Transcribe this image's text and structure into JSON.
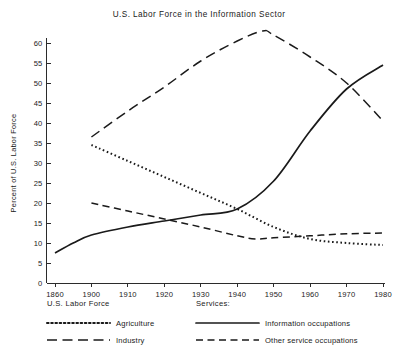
{
  "chart_data": {
    "type": "line",
    "title": "U.S. Labor Force in the Information Sector",
    "xlabel": "",
    "ylabel": "Percent of U.S. Labor Force",
    "xlim": [
      1860,
      1980
    ],
    "ylim": [
      0,
      63
    ],
    "yticks": [
      0,
      5,
      10,
      15,
      20,
      25,
      30,
      35,
      40,
      45,
      50,
      55,
      60
    ],
    "ytick_labels": [
      "0",
      "5",
      "10",
      "15",
      "20",
      "25",
      "30",
      "35",
      "40",
      "45",
      "50",
      "55",
      "60"
    ],
    "xticks": [
      1860,
      1900,
      1910,
      1920,
      1930,
      1940,
      1950,
      1960,
      1970,
      1980
    ],
    "xtick_labels": [
      "1860",
      "1900",
      "1910",
      "1920",
      "1930",
      "1940",
      "1950",
      "1960",
      "1970",
      "1980"
    ],
    "grid": false,
    "legend_position": "below-axes",
    "axis_note": "x axis is non-linear: 1860 and 1900 share one tick interval, decades evenly spaced thereafter",
    "series": [
      {
        "name": "Agriculture",
        "group": "U.S. Labor Force",
        "style": "dotted",
        "color": "#1a1a1a",
        "x": [
          1900,
          1910,
          1920,
          1930,
          1940,
          1950,
          1960,
          1970,
          1980
        ],
        "values": [
          34.5,
          30.5,
          26.5,
          22.5,
          18.5,
          14.0,
          11.0,
          10.0,
          9.5
        ]
      },
      {
        "name": "Industry",
        "group": "U.S. Labor Force",
        "style": "long-dash",
        "color": "#1a1a1a",
        "x": [
          1900,
          1910,
          1920,
          1930,
          1940,
          1947,
          1950,
          1960,
          1970,
          1980
        ],
        "values": [
          36.5,
          43.0,
          49.0,
          55.5,
          60.5,
          63.0,
          62.0,
          56.5,
          50.0,
          40.5
        ]
      },
      {
        "name": "Information occupations",
        "group": "Services",
        "style": "solid",
        "color": "#1a1a1a",
        "x": [
          1860,
          1880,
          1900,
          1910,
          1920,
          1930,
          1940,
          1950,
          1960,
          1970,
          1980
        ],
        "values": [
          7.5,
          10.0,
          12.0,
          14.0,
          15.5,
          17.0,
          18.5,
          25.5,
          38.0,
          48.5,
          54.5
        ]
      },
      {
        "name": "Other service occupations",
        "group": "Services",
        "style": "dash",
        "color": "#1a1a1a",
        "x": [
          1900,
          1910,
          1920,
          1930,
          1940,
          1945,
          1950,
          1960,
          1970,
          1980
        ],
        "values": [
          20.0,
          18.0,
          16.0,
          14.0,
          11.8,
          11.0,
          11.3,
          11.8,
          12.3,
          12.5
        ]
      }
    ]
  },
  "legend": {
    "left_heading": "U.S. Labor Force",
    "right_heading": "Services:",
    "entries": [
      {
        "label": "Agriculture",
        "style": "dotted"
      },
      {
        "label": "Industry",
        "style": "long-dash"
      },
      {
        "label": "Information occupations",
        "style": "solid"
      },
      {
        "label": "Other service occupations",
        "style": "dash"
      }
    ]
  }
}
